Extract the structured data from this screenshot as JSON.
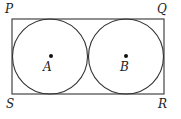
{
  "diagram": {
    "colors": {
      "stroke": "#333333",
      "text": "#222222",
      "background": "#ffffff"
    },
    "rectangle": {
      "vertices": {
        "P": {
          "label": "P",
          "x": 12,
          "y": 19
        },
        "Q": {
          "label": "Q",
          "x": 164,
          "y": 19
        },
        "R": {
          "label": "R",
          "x": 164,
          "y": 94
        },
        "S": {
          "label": "S",
          "x": 12,
          "y": 94
        }
      }
    },
    "circles": [
      {
        "center_label": "A",
        "cx": 50,
        "cy": 56.5,
        "r": 37.5
      },
      {
        "center_label": "B",
        "cx": 126,
        "cy": 56.5,
        "r": 37.5
      }
    ]
  }
}
